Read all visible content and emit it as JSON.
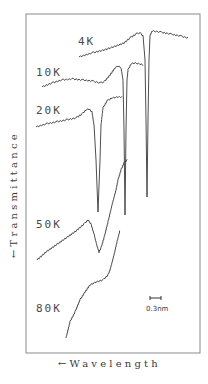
{
  "chart_data": {
    "type": "line",
    "title": "",
    "xlabel": "←Wavelength",
    "ylabel": "←Transmittance",
    "grid": false,
    "legend": "inline labels beside each trace",
    "scale_bar": {
      "label": "0.3nm",
      "length_px": 11
    },
    "note": "Vertically offset transmittance spectra vs wavelength at various temperatures; sharp absorption dips that broaden and shift with increasing temperature. Coordinates are approximate pixel positions (x right, y down) since no numeric ticks are shown.",
    "series": [
      {
        "name": "4K",
        "label_pos": [
          78,
          45
        ],
        "segments": [
          [
            [
              79,
              57
            ],
            [
              92,
              53
            ],
            [
              104,
              50
            ],
            [
              116,
              46
            ],
            [
              124,
              43
            ],
            [
              130,
              38
            ],
            [
              136,
              34
            ],
            [
              140,
              33
            ],
            [
              143,
              36
            ],
            [
              145,
              60
            ],
            [
              146,
              120
            ],
            [
              147,
              197
            ],
            [
              148,
              120
            ],
            [
              149,
              60
            ],
            [
              150,
              36
            ],
            [
              152,
              31
            ],
            [
              160,
              32
            ],
            [
              170,
              34
            ],
            [
              180,
              36
            ],
            [
              188,
              38
            ]
          ]
        ]
      },
      {
        "name": "10K",
        "label_pos": [
          36,
          76
        ],
        "segments": [
          [
            [
              42,
              87
            ],
            [
              52,
              83
            ],
            [
              62,
              80
            ],
            [
              72,
              79
            ],
            [
              82,
              80
            ],
            [
              92,
              81
            ],
            [
              100,
              83
            ],
            [
              104,
              82
            ],
            [
              110,
              75
            ],
            [
              115,
              68
            ],
            [
              118,
              66
            ],
            [
              121,
              68
            ],
            [
              123,
              80
            ],
            [
              124,
              130
            ],
            [
              125,
              215
            ],
            [
              126,
              130
            ],
            [
              127,
              80
            ],
            [
              128,
              70
            ],
            [
              131,
              64
            ],
            [
              134,
              63
            ],
            [
              140,
              64
            ],
            [
              143,
              65
            ]
          ]
        ]
      },
      {
        "name": "20K",
        "label_pos": [
          36,
          114
        ],
        "segments": [
          [
            [
              36,
              127
            ],
            [
              46,
              124
            ],
            [
              56,
              122
            ],
            [
              66,
              120
            ],
            [
              76,
              118
            ],
            [
              82,
              114
            ],
            [
              86,
              110
            ],
            [
              89,
              109
            ],
            [
              92,
              112
            ],
            [
              94,
              125
            ],
            [
              96,
              160
            ],
            [
              98,
              212
            ],
            [
              100,
              160
            ],
            [
              101,
              125
            ],
            [
              103,
              108
            ],
            [
              107,
              101
            ],
            [
              112,
              98
            ],
            [
              118,
              97
            ],
            [
              122,
              97
            ]
          ]
        ]
      },
      {
        "name": "50K",
        "label_pos": [
          36,
          228
        ],
        "segments": [
          [
            [
              37,
              260
            ],
            [
              46,
              252
            ],
            [
              56,
              245
            ],
            [
              66,
              238
            ],
            [
              76,
              231
            ],
            [
              84,
              224
            ],
            [
              88,
              220
            ],
            [
              91,
              224
            ],
            [
              94,
              234
            ],
            [
              97,
              246
            ],
            [
              99,
              252
            ],
            [
              101,
              248
            ],
            [
              104,
              238
            ],
            [
              108,
              222
            ],
            [
              112,
              205
            ],
            [
              116,
              190
            ],
            [
              118,
              180
            ],
            [
              121,
              170
            ],
            [
              124,
              163
            ],
            [
              127,
              160
            ]
          ]
        ]
      },
      {
        "name": "80K",
        "label_pos": [
          36,
          312
        ],
        "segments": [
          [
            [
              66,
              338
            ],
            [
              70,
              322
            ],
            [
              75,
              312
            ],
            [
              80,
              300
            ],
            [
              85,
              292
            ],
            [
              90,
              285
            ],
            [
              96,
              282
            ],
            [
              103,
              280
            ],
            [
              108,
              275
            ],
            [
              110,
              270
            ],
            [
              114,
              255
            ],
            [
              117,
              242
            ],
            [
              120,
              230
            ]
          ]
        ]
      }
    ],
    "frame": {
      "x0": 26,
      "y0": 14,
      "x1": 200,
      "y1": 353
    }
  },
  "labels": {
    "x_axis": "←Wavelength",
    "y_axis": "←Transmittance",
    "scale": "0.3nm",
    "curves": [
      "4K",
      "10K",
      "20K",
      "50K",
      "80K"
    ]
  }
}
